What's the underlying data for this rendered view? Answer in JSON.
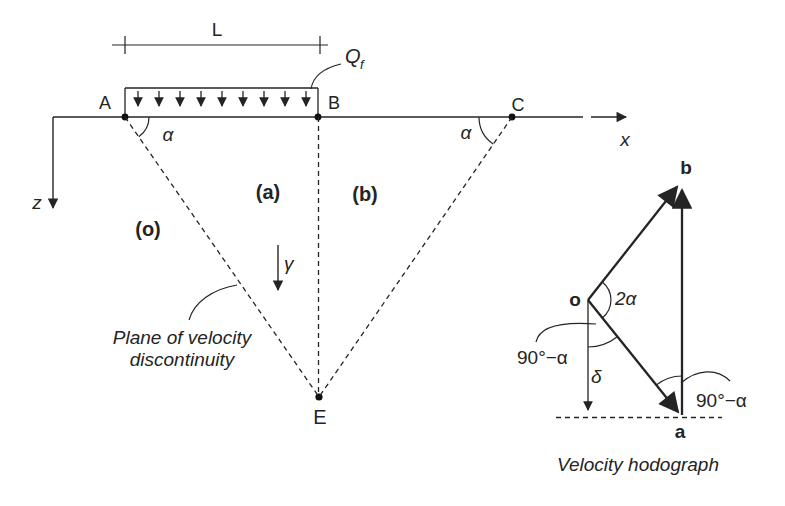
{
  "colors": {
    "ink": "#242424",
    "bg": "#ffffff"
  },
  "main_diagram": {
    "dimension_label": "L",
    "load_label": {
      "symbol": "Q",
      "subscript": "f"
    },
    "x_axis_label": "x",
    "z_axis_label": "z",
    "points": {
      "A": "A",
      "B": "B",
      "C": "C",
      "E": "E"
    },
    "angle_left": "α",
    "angle_right": "α",
    "soil_weight_label": "γ",
    "regions": {
      "o": "(o)",
      "a": "(a)",
      "b": "(b)"
    },
    "plane_caption_line1": "Plane of velocity",
    "plane_caption_line2": "discontinuity"
  },
  "hodograph": {
    "vertex_o": "o",
    "vertex_a": "a",
    "vertex_b": "b",
    "angle_at_o": "2α",
    "angle_left": "90°−α",
    "angle_right": "90°−α",
    "delta_label": "δ",
    "caption": "Velocity hodograph"
  }
}
